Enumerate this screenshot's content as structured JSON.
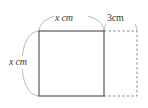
{
  "figure": {
    "type": "geometry-diagram",
    "background_color": "#ffffff",
    "solid_stroke_color": "#4a4a4a",
    "dashed_stroke_color": "#7a7a7a",
    "arc_stroke_color": "#9a9a9a",
    "text_color": "#3a3a3a",
    "square": {
      "name": "solid-square",
      "x": 39,
      "y": 31,
      "width": 65,
      "height": 65,
      "side_label_top": "x cm",
      "side_label_left": "x cm"
    },
    "extension": {
      "name": "dashed-rectangle",
      "x": 104,
      "y": 31,
      "width": 33,
      "height": 65,
      "width_label": "3cm"
    },
    "labels": {
      "top": {
        "variable": "x",
        "unit": "cm"
      },
      "left": {
        "variable": "x",
        "unit": "cm"
      },
      "right": {
        "value": "3",
        "unit": "cm"
      }
    }
  }
}
